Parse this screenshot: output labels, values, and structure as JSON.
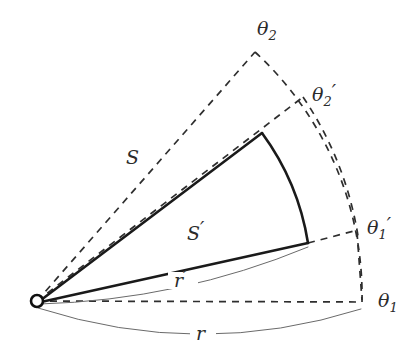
{
  "figure": {
    "type": "geometry-diagram",
    "width": 420,
    "height": 351,
    "background_color": "#ffffff",
    "line_color": "#1a1a1a",
    "dash_color": "#2e2e2e",
    "thin_color": "#6a6a6a",
    "label_color": "#2b2b2b"
  },
  "labels": {
    "theta2": {
      "base": "θ",
      "sub": "2",
      "prime": ""
    },
    "theta2p": {
      "base": "θ",
      "sub": "2",
      "prime": "′"
    },
    "theta1": {
      "base": "θ",
      "sub": "1",
      "prime": ""
    },
    "theta1p": {
      "base": "θ",
      "sub": "1",
      "prime": "′"
    },
    "S": {
      "base": "S",
      "sub": "",
      "prime": ""
    },
    "Sp": {
      "base": "S",
      "sub": "",
      "prime": "′"
    },
    "r": {
      "base": "r",
      "sub": "",
      "prime": ""
    },
    "rp": {
      "base": "r",
      "sub": "",
      "prime": "′"
    }
  },
  "geometry": {
    "origin": {
      "x": 37,
      "y": 301
    },
    "origin_radius": 6,
    "rays": {
      "theta1_end": {
        "x": 362,
        "y": 302
      },
      "theta2_end": {
        "x": 255,
        "y": 52
      },
      "theta1p_end": {
        "x": 355,
        "y": 232
      },
      "theta2p_end": {
        "x": 300,
        "y": 100
      }
    },
    "inner_sector": {
      "upper_end": {
        "x": 262,
        "y": 133
      },
      "lower_end": {
        "x": 308,
        "y": 243
      },
      "arc_radius": 253
    },
    "outer_arc": {
      "radius": 337
    },
    "measure_arcs": {
      "r_label_pos": {
        "x": 203,
        "y": 334
      },
      "rp_label_pos": {
        "x": 185,
        "y": 283
      }
    }
  },
  "label_positions": {
    "theta2": {
      "x": 257,
      "y": 35
    },
    "theta2p": {
      "x": 312,
      "y": 100
    },
    "theta1p": {
      "x": 367,
      "y": 233
    },
    "theta1": {
      "x": 378,
      "y": 306
    },
    "S": {
      "x": 126,
      "y": 163
    },
    "Sp": {
      "x": 187,
      "y": 239
    },
    "rp": {
      "x": 176,
      "y": 287
    },
    "r": {
      "x": 196,
      "y": 339
    }
  }
}
